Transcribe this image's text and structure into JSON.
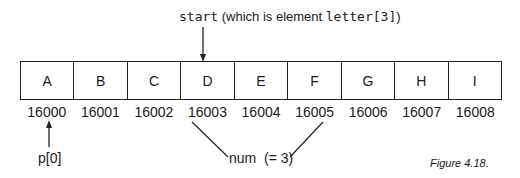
{
  "diagram": {
    "top_label": {
      "code_part": "start",
      "text_part": " (which is element ",
      "code_index": "letter[3]",
      "close": ")"
    },
    "cells": [
      "A",
      "B",
      "C",
      "D",
      "E",
      "F",
      "G",
      "H",
      "I"
    ],
    "addresses": [
      "16000",
      "16001",
      "16002",
      "16003",
      "16004",
      "16005",
      "16006",
      "16007",
      "16008"
    ],
    "pointer_label": "p[0]",
    "num_label": "num  (= 3)",
    "caption": "Figure 4.18.",
    "arrows": {
      "start_points_to_cell": "D",
      "p0_points_to_address": "16000",
      "num_spans_addresses": [
        "16003",
        "16005"
      ]
    }
  }
}
